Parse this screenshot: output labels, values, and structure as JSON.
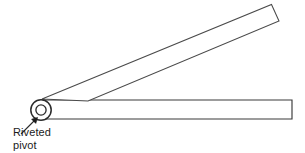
{
  "figure": {
    "background_color": "#ffffff",
    "line_color": "#3a3a3a",
    "line_color_dark": "#2b2b2b",
    "text_color": "#1b1b1b",
    "annotation": {
      "line1": "Riveted",
      "line2": "pivot"
    }
  },
  "diagram_data": {
    "type": "line-drawing",
    "canvas": {
      "width": 305,
      "height": 153
    },
    "parts": [
      {
        "name": "lower-arm",
        "shape": "rectangle",
        "points": [
          [
            41,
            100
          ],
          [
            292,
            100
          ],
          [
            292,
            119
          ],
          [
            41,
            119
          ]
        ],
        "orientation": "horizontal"
      },
      {
        "name": "upper-arm",
        "shape": "rotated-rectangle",
        "points": [
          [
            42,
            99
          ],
          [
            272,
            5
          ],
          [
            279,
            21
          ],
          [
            88,
            101
          ]
        ],
        "orientation": "angled-up-right"
      },
      {
        "name": "pivot-rivet",
        "shape": "concentric-circles",
        "center": [
          41,
          110
        ],
        "outer_radius": 10,
        "inner_radius": 5
      },
      {
        "name": "leader-line",
        "shape": "arrow",
        "from": [
          21,
          134
        ],
        "to": [
          37,
          118
        ]
      }
    ]
  }
}
